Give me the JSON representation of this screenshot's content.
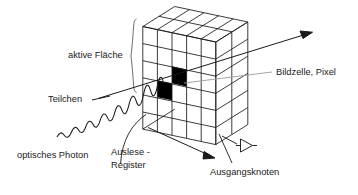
{
  "figure": {
    "type": "isometric-diagram",
    "background_color": "#ffffff",
    "line_color": "#1a1a1a",
    "pixel_fill_color": "#000000",
    "leader_line_color": "#999999"
  },
  "sensor_array": {
    "columns": 5,
    "rows": 6,
    "active_pixels": [
      {
        "column": 3,
        "row": 3
      },
      {
        "column": 2,
        "row": 4
      }
    ]
  },
  "labels": {
    "active_area": "aktive Fläche",
    "particle": "Teilchen",
    "pixel_cell": "Bildzelle, Pixel",
    "optical_photon": "optisches Photon",
    "readout_register_line1": "Auslese -",
    "readout_register_line2": "Register",
    "output_node": "Ausgangsknoten"
  },
  "annotations": {
    "brace": "curly-brace-vertical",
    "particle_track": "straight-arrow-up-right",
    "photon_wave": "sine-wave-arrow",
    "readout_arrow": "arrow-down-right",
    "amplifier": "triangle-amplifier-symbol"
  }
}
